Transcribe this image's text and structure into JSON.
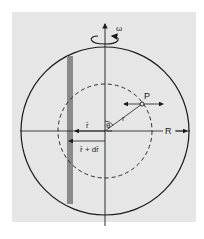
{
  "diagram": {
    "labels": {
      "omega": "ω",
      "point": "P",
      "radius_small": "r",
      "angle": "θ",
      "r_vec": "r̄",
      "r_plus_dr": "r̄ + dr̄",
      "big_radius": "R"
    },
    "colors": {
      "background": "#e6e6e6",
      "ink": "#1a1a1a",
      "shell_strip": "#8a8a8a"
    }
  }
}
